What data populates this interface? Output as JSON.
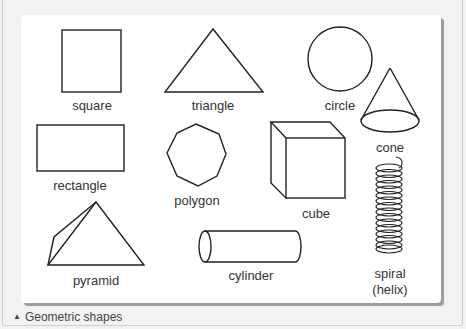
{
  "figure": {
    "caption_icon": "▲",
    "caption": "Geometric shapes",
    "shapes": [
      {
        "id": "square",
        "label": "square"
      },
      {
        "id": "triangle",
        "label": "triangle"
      },
      {
        "id": "circle",
        "label": "circle"
      },
      {
        "id": "cone",
        "label": "cone"
      },
      {
        "id": "rectangle",
        "label": "rectangle"
      },
      {
        "id": "polygon",
        "label": "polygon"
      },
      {
        "id": "cube",
        "label": "cube"
      },
      {
        "id": "pyramid",
        "label": "pyramid"
      },
      {
        "id": "cylinder",
        "label": "cylinder"
      },
      {
        "id": "spiral",
        "label": "spiral",
        "sublabel": "(helix)"
      }
    ]
  }
}
